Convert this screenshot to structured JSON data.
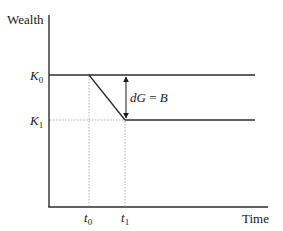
{
  "diagram": {
    "y_axis_label": "Wealth",
    "x_axis_label": "Time",
    "levels": {
      "k0": {
        "base": "K",
        "sub": "0"
      },
      "k1": {
        "base": "K",
        "sub": "1"
      }
    },
    "times": {
      "t0": {
        "base": "t",
        "sub": "0"
      },
      "t1": {
        "base": "t",
        "sub": "1"
      }
    },
    "annotation": {
      "lhs": "dG",
      "eq": " = ",
      "rhs": "B"
    }
  },
  "colors": {
    "line": "#2b2b2b",
    "guide": "#9a9a9a",
    "text": "#1a1a1a"
  }
}
